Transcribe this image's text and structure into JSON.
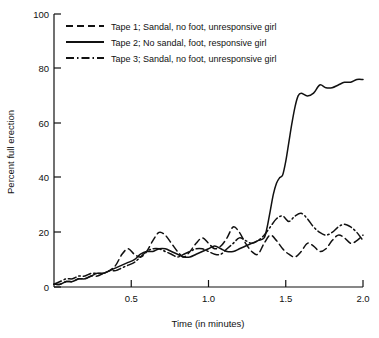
{
  "chart_data": {
    "type": "line",
    "title": "",
    "xlabel": "Time (in minutes)",
    "ylabel": "Percent full erection",
    "xlim": [
      0,
      2.0
    ],
    "ylim": [
      0,
      100
    ],
    "xticks": [
      0.5,
      1.0,
      1.5,
      2.0
    ],
    "xtick_labels": [
      "0.5",
      "1.0",
      "1.5",
      "2.0"
    ],
    "yticks": [
      0,
      20,
      40,
      60,
      80,
      100
    ],
    "ytick_labels": [
      "0",
      "20",
      "40",
      "60",
      "80",
      "100"
    ],
    "grid": false,
    "legend_position": "top-left-inside",
    "series": [
      {
        "name": "Tape 1; Sandal, no foot, unresponsive girl",
        "style": "dashed",
        "x": [
          0.0,
          0.04,
          0.08,
          0.12,
          0.16,
          0.2,
          0.24,
          0.28,
          0.32,
          0.36,
          0.4,
          0.44,
          0.48,
          0.52,
          0.56,
          0.6,
          0.64,
          0.68,
          0.72,
          0.76,
          0.8,
          0.84,
          0.88,
          0.92,
          0.96,
          1.0,
          1.04,
          1.08,
          1.12,
          1.16,
          1.2,
          1.24,
          1.28,
          1.32,
          1.36,
          1.4,
          1.44,
          1.48,
          1.52,
          1.56,
          1.6,
          1.64,
          1.68,
          1.72,
          1.76,
          1.8,
          1.84,
          1.88,
          1.92,
          1.96,
          2.0
        ],
        "y": [
          1,
          1,
          2,
          2,
          3,
          3,
          4,
          4,
          5,
          6,
          8,
          12,
          14,
          12,
          11,
          13,
          17,
          20,
          19,
          16,
          13,
          11,
          13,
          16,
          18,
          16,
          14,
          15,
          18,
          22,
          20,
          16,
          13,
          12,
          16,
          19,
          17,
          14,
          12,
          11,
          13,
          16,
          15,
          13,
          14,
          17,
          19,
          18,
          16,
          17,
          19
        ]
      },
      {
        "name": "Tape 2; No sandal, foot, responsive girl",
        "style": "solid",
        "x": [
          0.0,
          0.04,
          0.08,
          0.12,
          0.16,
          0.2,
          0.24,
          0.28,
          0.32,
          0.36,
          0.4,
          0.44,
          0.48,
          0.52,
          0.56,
          0.6,
          0.64,
          0.68,
          0.72,
          0.76,
          0.8,
          0.84,
          0.88,
          0.92,
          0.96,
          1.0,
          1.04,
          1.08,
          1.12,
          1.16,
          1.2,
          1.24,
          1.28,
          1.32,
          1.36,
          1.38,
          1.4,
          1.42,
          1.44,
          1.46,
          1.48,
          1.5,
          1.52,
          1.54,
          1.56,
          1.58,
          1.6,
          1.64,
          1.68,
          1.72,
          1.76,
          1.8,
          1.84,
          1.88,
          1.92,
          1.96,
          2.0
        ],
        "y": [
          1,
          1,
          2,
          2,
          3,
          3,
          4,
          5,
          5,
          6,
          7,
          8,
          9,
          10,
          12,
          13,
          13,
          14,
          14,
          13,
          12,
          11,
          11,
          12,
          13,
          14,
          15,
          14,
          13,
          13,
          14,
          15,
          16,
          17,
          18,
          22,
          28,
          34,
          38,
          40,
          41,
          46,
          53,
          60,
          66,
          70,
          71,
          70,
          71,
          74,
          73,
          73,
          74,
          75,
          75,
          76,
          76
        ]
      },
      {
        "name": "Tape 3; Sandal, no foot, unresponsive girl",
        "style": "dashdot",
        "x": [
          0.0,
          0.04,
          0.08,
          0.12,
          0.16,
          0.2,
          0.24,
          0.28,
          0.32,
          0.36,
          0.4,
          0.44,
          0.48,
          0.52,
          0.56,
          0.6,
          0.64,
          0.68,
          0.72,
          0.76,
          0.8,
          0.84,
          0.88,
          0.92,
          0.96,
          1.0,
          1.04,
          1.08,
          1.12,
          1.16,
          1.2,
          1.24,
          1.28,
          1.32,
          1.36,
          1.4,
          1.44,
          1.48,
          1.52,
          1.56,
          1.6,
          1.64,
          1.68,
          1.72,
          1.76,
          1.8,
          1.84,
          1.88,
          1.92,
          1.96,
          2.0
        ],
        "y": [
          1,
          2,
          3,
          3,
          4,
          4,
          5,
          5,
          5,
          6,
          6,
          7,
          8,
          9,
          11,
          13,
          14,
          14,
          13,
          12,
          11,
          12,
          13,
          14,
          14,
          13,
          12,
          12,
          14,
          16,
          18,
          17,
          16,
          17,
          19,
          22,
          25,
          26,
          24,
          26,
          27,
          25,
          22,
          20,
          19,
          20,
          22,
          23,
          22,
          20,
          17
        ]
      }
    ]
  },
  "legend": {
    "entries": [
      {
        "label": "Tape 1; Sandal, no foot, unresponsive girl",
        "style": "dashed"
      },
      {
        "label": "Tape 2; No sandal, foot, responsive girl",
        "style": "solid"
      },
      {
        "label": "Tape 3; Sandal, no foot, unresponsive girl",
        "style": "dashdot"
      }
    ]
  }
}
